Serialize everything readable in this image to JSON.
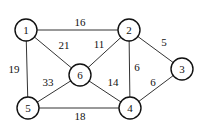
{
  "graph": {
    "nodes": [
      {
        "id": "1",
        "label": "1",
        "x": 26,
        "y": 30
      },
      {
        "id": "2",
        "label": "2",
        "x": 129,
        "y": 30
      },
      {
        "id": "3",
        "label": "3",
        "x": 182,
        "y": 69
      },
      {
        "id": "4",
        "label": "4",
        "x": 130,
        "y": 108
      },
      {
        "id": "5",
        "label": "5",
        "x": 28,
        "y": 108
      },
      {
        "id": "6",
        "label": "6",
        "x": 80,
        "y": 75
      }
    ],
    "edges": [
      {
        "from": "1",
        "to": "2",
        "weight": "16",
        "lx": 80,
        "ly": 22
      },
      {
        "from": "1",
        "to": "6",
        "weight": "21",
        "lx": 64,
        "ly": 45
      },
      {
        "from": "1",
        "to": "5",
        "weight": "19",
        "lx": 14,
        "ly": 69
      },
      {
        "from": "2",
        "to": "6",
        "weight": "11",
        "lx": 99,
        "ly": 44
      },
      {
        "from": "2",
        "to": "3",
        "weight": "5",
        "lx": 164,
        "ly": 42
      },
      {
        "from": "2",
        "to": "4",
        "weight": "6",
        "lx": 137,
        "ly": 67
      },
      {
        "from": "6",
        "to": "5",
        "weight": "33",
        "lx": 48,
        "ly": 82
      },
      {
        "from": "6",
        "to": "4",
        "weight": "14",
        "lx": 113,
        "ly": 82
      },
      {
        "from": "3",
        "to": "4",
        "weight": "6",
        "lx": 153,
        "ly": 82
      },
      {
        "from": "5",
        "to": "4",
        "weight": "18",
        "lx": 80,
        "ly": 116
      }
    ]
  }
}
